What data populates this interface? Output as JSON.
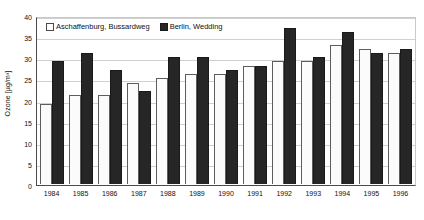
{
  "chart_data": {
    "type": "bar",
    "title": "",
    "subtitle": "",
    "xlabel": "",
    "ylabel": "Ozone [µg/m³]",
    "categories": [
      "1984",
      "1985",
      "1986",
      "1987",
      "1988",
      "1989",
      "1990",
      "1991",
      "1992",
      "1993",
      "1994",
      "1995",
      "1996"
    ],
    "series": [
      {
        "name": "Aschaffenburg, Bussardweg",
        "color": "#ffffff",
        "values": [
          19,
          21,
          21,
          24,
          25,
          26,
          26,
          28,
          29,
          29,
          33,
          32,
          31
        ]
      },
      {
        "name": "Berlin, Wedding",
        "color": "#262626",
        "values": [
          29,
          31,
          27,
          22,
          30,
          30,
          27,
          28,
          37,
          30,
          36,
          31,
          32
        ]
      }
    ],
    "ylim": [
      0,
      40
    ],
    "yticks": [
      0,
      5,
      10,
      15,
      20,
      25,
      30,
      35,
      40
    ],
    "ytick_labels": [
      "0",
      "5",
      "10",
      "15",
      "20",
      "25",
      "30",
      "35",
      "40"
    ],
    "grid": true,
    "grid_axis": "y",
    "legend_position": "top-left-inside"
  },
  "legend": {
    "entries": [
      {
        "label": "Aschaffenburg, Bussardweg",
        "swatch": "light"
      },
      {
        "label": "Berlin, Wedding",
        "swatch": "dark"
      }
    ]
  }
}
